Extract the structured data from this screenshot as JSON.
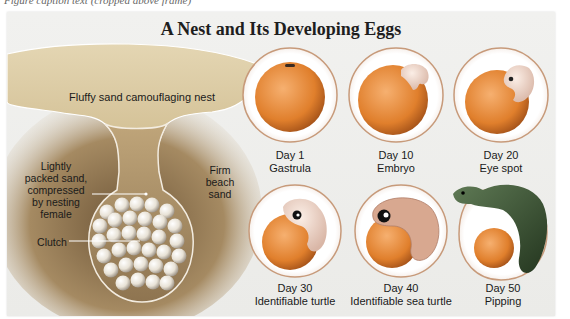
{
  "cropped_caption": "Figure caption text (cropped above frame)",
  "figure": {
    "title": "A Nest and Its Developing Eggs",
    "nest_labels": {
      "top": "Fluffy sand camouflaging nest",
      "left_line1": "Lightly",
      "left_line2": "packed sand,",
      "left_line3": "compressed",
      "left_line4": "by nesting",
      "left_line5": "female",
      "right_line1": "Firm",
      "right_line2": "beach",
      "right_line3": "sand",
      "clutch": "Clutch"
    },
    "stages": [
      {
        "day": "Day 1",
        "name": "Gastrula"
      },
      {
        "day": "Day 10",
        "name": "Embryo"
      },
      {
        "day": "Day 20",
        "name": "Eye spot"
      },
      {
        "day": "Day 30",
        "name": "Identifiable turtle"
      },
      {
        "day": "Day 40",
        "name": "Identifiable sea turtle"
      },
      {
        "day": "Day 50",
        "name": "Pipping"
      }
    ],
    "colors": {
      "sand_top": "#d9c9a0",
      "sand_neck": "#b89a68",
      "dark_sand": "#7a6546",
      "yolk": "#e98a3a",
      "egg_ring": "#c79a7a",
      "embryo": "#f2dcd0",
      "turtle": "#3d5a3a"
    }
  }
}
